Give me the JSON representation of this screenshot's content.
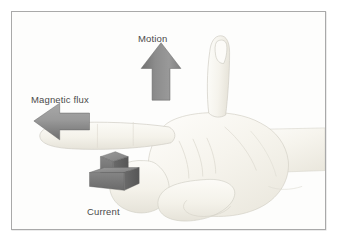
{
  "figure": {
    "background_color": "#ffffff",
    "panel_background": "#fdfdfc",
    "border_color": "#a9a9a9",
    "label_color": "#4a4a4a"
  },
  "labels": {
    "motion": "Motion",
    "magnetic_flux": "Magnetic flux",
    "current": "Current"
  },
  "arrows": {
    "motion": {
      "label": "Motion",
      "direction": "up",
      "style": "flat-block-arrow",
      "color_light": "#9a9a9a",
      "color_dark": "#6d6d6d"
    },
    "magnetic_flux": {
      "label": "Magnetic flux",
      "direction": "left",
      "style": "flat-block-arrow",
      "color_light": "#a4a4a4",
      "color_dark": "#707070"
    },
    "current": {
      "label": "Current",
      "direction": "down-into-page",
      "style": "3d-block-arrow",
      "color_top": "#8e8e8e",
      "color_front": "#787878",
      "color_side": "#5f5f5f"
    }
  },
  "hand": {
    "description": "Right hand, palm toward viewer, index finger pointing left, thumb up, remaining fingers curled",
    "skin_light": "#fbfaf6",
    "skin_mid": "#f2f0e9",
    "skin_shadow": "#e4e1d8",
    "outline": "#cfcdc4"
  }
}
